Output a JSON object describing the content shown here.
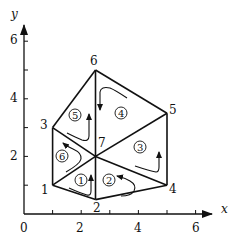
{
  "figure": {
    "x_axis": {
      "label": "x",
      "ticks": [
        0,
        1,
        2,
        3,
        4,
        5,
        6
      ],
      "tick_labels": [
        "0",
        "2",
        "4",
        "6"
      ],
      "tick_label_values": [
        0,
        2,
        4,
        6
      ]
    },
    "y_axis": {
      "label": "y",
      "ticks": [
        1,
        2,
        3,
        4,
        5,
        6
      ],
      "tick_labels": [
        "2",
        "4",
        "6"
      ],
      "tick_label_values": [
        2,
        4,
        6
      ]
    },
    "nodes": [
      {
        "id": "1",
        "x": 1.0,
        "y": 1.0
      },
      {
        "id": "2",
        "x": 2.5,
        "y": 0.5
      },
      {
        "id": "3",
        "x": 1.0,
        "y": 3.0
      },
      {
        "id": "4",
        "x": 5.0,
        "y": 1.0
      },
      {
        "id": "5",
        "x": 5.0,
        "y": 3.5
      },
      {
        "id": "6",
        "x": 2.5,
        "y": 5.0
      },
      {
        "id": "7",
        "x": 2.5,
        "y": 2.0
      }
    ],
    "elements": [
      {
        "id": "1",
        "label": "①",
        "nodes": [
          "1",
          "2",
          "7"
        ]
      },
      {
        "id": "2",
        "label": "②",
        "nodes": [
          "2",
          "4",
          "7"
        ]
      },
      {
        "id": "3",
        "label": "③",
        "nodes": [
          "4",
          "5",
          "7"
        ]
      },
      {
        "id": "4",
        "label": "④",
        "nodes": [
          "5",
          "6",
          "7"
        ]
      },
      {
        "id": "5",
        "label": "⑤",
        "nodes": [
          "6",
          "3",
          "7"
        ]
      },
      {
        "id": "6",
        "label": "⑥",
        "nodes": [
          "3",
          "1",
          "7"
        ]
      }
    ]
  }
}
